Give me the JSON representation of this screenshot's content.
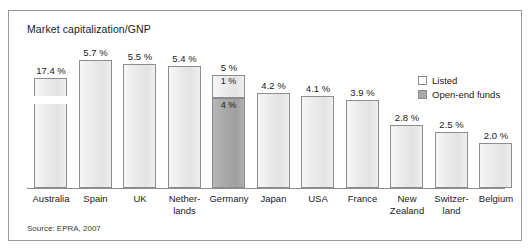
{
  "figure": {
    "title": "Market capitalization/GNP",
    "source": "Source: EPRA, 2007"
  },
  "legend": {
    "position": "top-right",
    "items": [
      {
        "label": "Listed",
        "swatch": "white",
        "color": "#ffffff"
      },
      {
        "label": "Open-end funds",
        "swatch": "gray",
        "color": "#a9a9a9"
      }
    ]
  },
  "chart_data": {
    "type": "bar",
    "title": "Market capitalization/GNP",
    "xlabel": "",
    "ylabel": "",
    "unit": "%",
    "grid": false,
    "legend_position": "top-right",
    "axis_note": "Australia bar is drawn with an axis break (truncated bar)",
    "ylim": [
      0,
      6
    ],
    "categories": [
      "Australia",
      "Spain",
      "UK",
      "Netherlands",
      "Germany",
      "Japan",
      "USA",
      "France",
      "New Zealand",
      "Switzerland",
      "Belgium"
    ],
    "series": [
      {
        "name": "Listed",
        "values": [
          17.4,
          5.7,
          5.5,
          5.4,
          1,
          4.2,
          4.1,
          3.9,
          2.8,
          2.5,
          2.0
        ]
      },
      {
        "name": "Open-end funds",
        "values": [
          0,
          0,
          0,
          0,
          4,
          0,
          0,
          0,
          0,
          0,
          0
        ]
      }
    ],
    "totals": [
      17.4,
      5.7,
      5.5,
      5.4,
      5,
      4.2,
      4.1,
      3.9,
      2.8,
      2.5,
      2.0
    ],
    "data_labels": [
      "17.4 %",
      "5.7 %",
      "5.5 %",
      "5.4 %",
      "5 %",
      "4.2 %",
      "4.1 %",
      "3.9 %",
      "2.8 %",
      "2.5 %",
      "2.0 %"
    ]
  },
  "bars": [
    {
      "category_line1": "Australia",
      "category_line2": "",
      "value_label": "17.4 %",
      "broken": true,
      "segments": []
    },
    {
      "category_line1": "Spain",
      "category_line2": "",
      "value_label": "5.7 %",
      "broken": false,
      "segments": []
    },
    {
      "category_line1": "UK",
      "category_line2": "",
      "value_label": "5.5 %",
      "broken": false,
      "segments": []
    },
    {
      "category_line1": "Nether-",
      "category_line2": "lands",
      "value_label": "5.4 %",
      "broken": false,
      "segments": []
    },
    {
      "category_line1": "Germany",
      "category_line2": "",
      "value_label": "5 %",
      "broken": false,
      "segments": [
        {
          "label": "1 %",
          "type": "listed"
        },
        {
          "label": "4 %",
          "type": "funds"
        }
      ]
    },
    {
      "category_line1": "Japan",
      "category_line2": "",
      "value_label": "4.2 %",
      "broken": false,
      "segments": []
    },
    {
      "category_line1": "USA",
      "category_line2": "",
      "value_label": "4.1 %",
      "broken": false,
      "segments": []
    },
    {
      "category_line1": "France",
      "category_line2": "",
      "value_label": "3.9 %",
      "broken": false,
      "segments": []
    },
    {
      "category_line1": "New",
      "category_line2": "Zealand",
      "value_label": "2.8 %",
      "broken": false,
      "segments": []
    },
    {
      "category_line1": "Switzer-",
      "category_line2": "land",
      "value_label": "2.5 %",
      "broken": false,
      "segments": []
    },
    {
      "category_line1": "Belgium",
      "category_line2": "",
      "value_label": "2.0 %",
      "broken": false,
      "segments": []
    }
  ]
}
